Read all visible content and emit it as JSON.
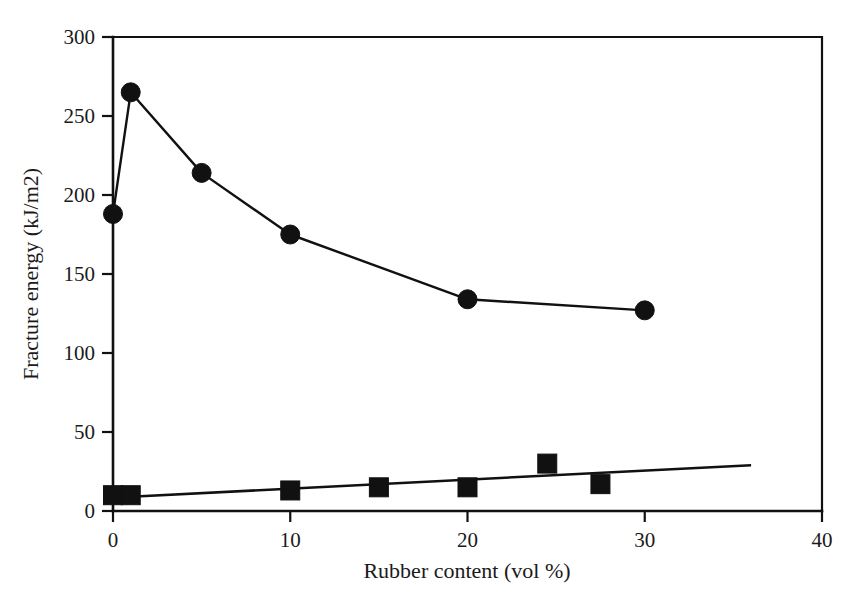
{
  "chart_data": {
    "type": "scatter",
    "title": "",
    "xlabel": "Rubber content (vol %)",
    "ylabel": "Fracture energy (kJ/m2)",
    "xlim": [
      0,
      40
    ],
    "ylim": [
      0,
      300
    ],
    "xticks": [
      "0",
      "10",
      "20",
      "30",
      "40"
    ],
    "xtick_values": [
      0,
      10,
      20,
      30,
      40
    ],
    "yticks": [
      "0",
      "50",
      "100",
      "150",
      "200",
      "250",
      "300"
    ],
    "ytick_values": [
      0,
      50,
      100,
      150,
      200,
      250,
      300
    ],
    "grid": false,
    "legend": "none",
    "series": [
      {
        "name": "fracture-energy-circles",
        "marker": "circle",
        "connected": true,
        "x": [
          0,
          1,
          5,
          10,
          20,
          30
        ],
        "values": [
          188,
          265,
          214,
          175,
          134,
          127
        ]
      },
      {
        "name": "fracture-energy-squares",
        "marker": "square",
        "connected": false,
        "x": [
          0,
          1,
          10,
          15,
          20,
          24.5,
          27.5
        ],
        "values": [
          10,
          10,
          13,
          15,
          15,
          30,
          17
        ],
        "trendline": {
          "x": [
            1,
            36
          ],
          "values": [
            9,
            29
          ]
        }
      }
    ]
  },
  "colors": {
    "ink": "#111111",
    "background": "#ffffff"
  }
}
